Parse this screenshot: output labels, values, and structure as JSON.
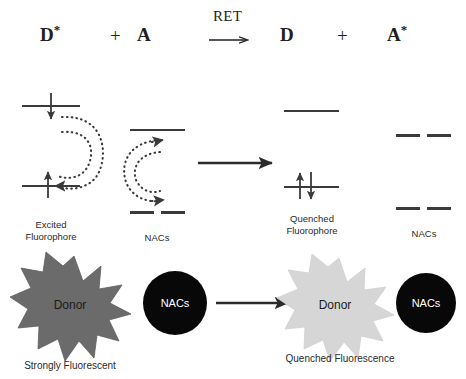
{
  "figure": {
    "background": "#ffffff"
  },
  "equation": {
    "donor_excited": "D",
    "donor_excited_star": "*",
    "plus_left": "+",
    "acceptor": "A",
    "ret_label": "RET",
    "donor_ground": "D",
    "plus_right": "+",
    "acceptor_excited": "A",
    "acceptor_excited_star": "*"
  },
  "orbital_row": {
    "excited_fluorophore": {
      "label": "Excited\nFluorophore",
      "upper_level": "HOMO-excited upper level",
      "lower_level": "ground level",
      "upper_arrow": "down-arrow",
      "lower_arrow": "up-arrow"
    },
    "nacs_left": {
      "label": "NACs",
      "upper_level": "solid level",
      "lower_level": "dashed level"
    },
    "transfer_arrow": "right-arrow",
    "quenched_fluorophore": {
      "label": "Quenched\nFluorophore",
      "upper_level": "empty upper level",
      "lower_level": "paired level",
      "paired_arrows": "up-down-pair"
    },
    "nacs_right": {
      "label": "NACs",
      "upper_level": "dashed level",
      "lower_level": "dashed level"
    }
  },
  "particle_row": {
    "donor_bright": {
      "shape_label": "Donor",
      "caption": "Strongly Fluorescent",
      "fill": "#6b6b6b"
    },
    "nacs_left_circle": {
      "label": "NACs",
      "fill": "#080808"
    },
    "transfer_arrow": "right-arrow",
    "donor_quenched": {
      "shape_label": "Donor",
      "caption": "Quenched Fluorescence",
      "fill": "#d6d6d6"
    },
    "nacs_right_circle": {
      "label": "NACs",
      "fill": "#080808"
    }
  },
  "colors": {
    "stroke": "#3a3a3a",
    "text": "#231f20",
    "bright_star": "#6b6b6b",
    "quenched_star": "#d6d6d6",
    "circle": "#080808"
  }
}
